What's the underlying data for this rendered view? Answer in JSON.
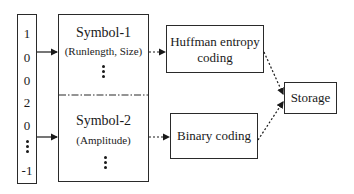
{
  "diagram": {
    "input_sequence": {
      "values": [
        "1",
        "0",
        "0",
        "2",
        "0",
        "⋮",
        "-1"
      ]
    },
    "symbol_box": {
      "symbol1": {
        "title": "Symbol-1",
        "subtitle": "(Runlength, Size)"
      },
      "symbol2": {
        "title": "Symbol-2",
        "subtitle": "(Amplitude)"
      }
    },
    "huffman": {
      "line1": "Huffman entropy",
      "line2": "coding"
    },
    "binary": {
      "label": "Binary coding"
    },
    "storage": {
      "label": "Storage"
    },
    "edges": [
      {
        "from": "input_sequence",
        "to": "symbol1",
        "style": "solid"
      },
      {
        "from": "input_sequence",
        "to": "symbol2",
        "style": "solid"
      },
      {
        "from": "symbol1",
        "to": "huffman",
        "style": "dotted"
      },
      {
        "from": "symbol2",
        "to": "binary",
        "style": "dotted"
      },
      {
        "from": "huffman",
        "to": "storage",
        "style": "dotted"
      },
      {
        "from": "binary",
        "to": "storage",
        "style": "dotted"
      }
    ]
  }
}
